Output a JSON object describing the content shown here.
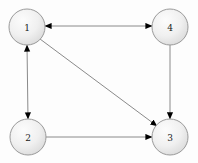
{
  "diagram": {
    "type": "directed-graph",
    "title": "",
    "background_color": "#fdfdfd",
    "node_fill_color": "#ececec",
    "node_highlight_color": "#fbfbfb",
    "node_stroke_color": "#9a9a9a",
    "edge_color": "#8a8a8a",
    "arrowhead_color": "#000000",
    "node_radius": 18,
    "nodes": [
      {
        "id": "1",
        "label": "1",
        "cx": 27,
        "cy": 27
      },
      {
        "id": "4",
        "label": "4",
        "cx": 170,
        "cy": 27
      },
      {
        "id": "2",
        "label": "2",
        "cx": 28,
        "cy": 137
      },
      {
        "id": "3",
        "label": "3",
        "cx": 170,
        "cy": 137
      }
    ],
    "edges": [
      {
        "id": "e-1-4",
        "from": "1",
        "to": "4",
        "direction": "both",
        "label": ""
      },
      {
        "id": "e-1-2",
        "from": "1",
        "to": "2",
        "direction": "both",
        "label": ""
      },
      {
        "id": "e-1-3",
        "from": "1",
        "to": "3",
        "direction": "forward",
        "label": ""
      },
      {
        "id": "e-4-3",
        "from": "4",
        "to": "3",
        "direction": "forward",
        "label": ""
      },
      {
        "id": "e-2-3",
        "from": "2",
        "to": "3",
        "direction": "forward",
        "label": ""
      }
    ]
  }
}
